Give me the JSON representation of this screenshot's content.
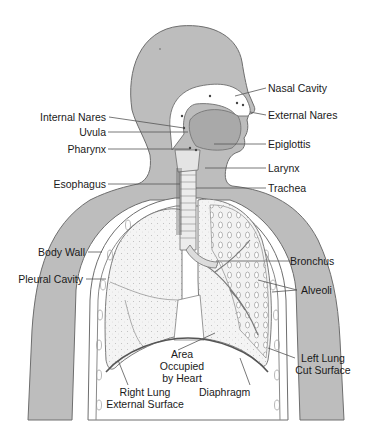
{
  "diagram": {
    "colors": {
      "background": "#ffffff",
      "body_fill": "#bdbdbd",
      "body_outline": "#6e6e6e",
      "organ_fill": "#f4f4f4",
      "head_cavity_fill": "#ffffff",
      "tongue_fill": "#a9a9a9",
      "leader_line": "#555555",
      "text": "#1a1a1a"
    },
    "labels": {
      "nasal_cavity": "Nasal Cavity",
      "external_nares": "External Nares",
      "internal_nares": "Internal Nares",
      "uvula": "Uvula",
      "pharynx": "Pharynx",
      "epiglottis": "Epiglottis",
      "larynx": "Larynx",
      "esophagus": "Esophagus",
      "trachea": "Trachea",
      "body_wall": "Body Wall",
      "pleural_cavity": "Pleural Cavity",
      "bronchus": "Bronchus",
      "alveoli": "Alveoli",
      "area_occupied_by_heart": [
        "Area",
        "Occupied",
        "by Heart"
      ],
      "left_lung_cut_surface": [
        "Left Lung",
        "Cut Surface"
      ],
      "right_lung_external_surface": [
        "Right Lung",
        "External Surface"
      ],
      "diaphragm": "Diaphragm"
    }
  }
}
